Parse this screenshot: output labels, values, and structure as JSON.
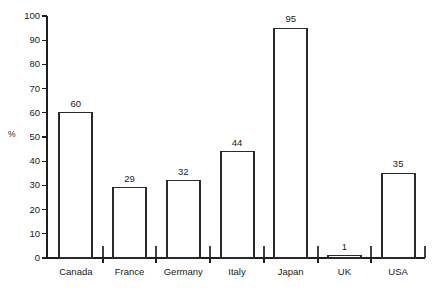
{
  "chart_data": {
    "type": "bar",
    "title": "",
    "xlabel": "",
    "ylabel": "%",
    "ylim": [
      0,
      100
    ],
    "ytick_step": 10,
    "grid": false,
    "legend": "none",
    "categories": [
      "Canada",
      "France",
      "Germany",
      "Italy",
      "Japan",
      "UK",
      "USA"
    ],
    "values": [
      60,
      29,
      32,
      44,
      95,
      1,
      35
    ],
    "value_labels": [
      "60",
      "29",
      "32",
      "44",
      "95",
      "1",
      "35"
    ],
    "ytick_labels": [
      "0",
      "10",
      "20",
      "30",
      "40",
      "50",
      "60",
      "70",
      "80",
      "90",
      "100"
    ],
    "bar_style": "outline",
    "bar_fill_color": "#ffffff",
    "bar_edge_color": "#2a2a2a",
    "axis_color": "#1f1f1f",
    "background_color": "#ffffff"
  },
  "caption": {
    "text": ""
  }
}
